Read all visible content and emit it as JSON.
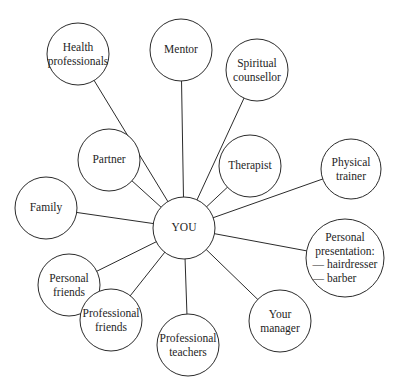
{
  "diagram": {
    "title": "",
    "center": {
      "id": "you",
      "label": [
        "YOU"
      ],
      "cx": 184,
      "cy": 228,
      "r": 31
    },
    "nodes": [
      {
        "id": "health-professionals",
        "label": [
          "Health",
          "professionals"
        ],
        "cx": 78,
        "cy": 54,
        "r": 31
      },
      {
        "id": "mentor",
        "label": [
          "Mentor"
        ],
        "cx": 181,
        "cy": 50,
        "r": 31
      },
      {
        "id": "spiritual-counsellor",
        "label": [
          "Spiritual",
          "counsellor"
        ],
        "cx": 257,
        "cy": 70,
        "r": 31
      },
      {
        "id": "partner",
        "label": [
          "Partner"
        ],
        "cx": 109,
        "cy": 160,
        "r": 31
      },
      {
        "id": "therapist",
        "label": [
          "Therapist"
        ],
        "cx": 250,
        "cy": 166,
        "r": 31
      },
      {
        "id": "physical-trainer",
        "label": [
          "Physical",
          "trainer"
        ],
        "cx": 351,
        "cy": 169,
        "r": 30
      },
      {
        "id": "family",
        "label": [
          "Family"
        ],
        "cx": 46,
        "cy": 208,
        "r": 31
      },
      {
        "id": "personal-presentation",
        "label": [
          "Personal",
          "presentation:",
          "— hairdresser",
          "— barber"
        ],
        "cx": 345,
        "cy": 258,
        "r": 39
      },
      {
        "id": "personal-friends",
        "label": [
          "Personal",
          "friends"
        ],
        "cx": 69,
        "cy": 285,
        "r": 31
      },
      {
        "id": "professional-friends",
        "label": [
          "Professional",
          "friends"
        ],
        "cx": 111,
        "cy": 320,
        "r": 31
      },
      {
        "id": "professional-teachers",
        "label": [
          "Professional",
          "teachers"
        ],
        "cx": 188,
        "cy": 345,
        "r": 31
      },
      {
        "id": "your-manager",
        "label": [
          "Your",
          "manager"
        ],
        "cx": 280,
        "cy": 321,
        "r": 31
      }
    ],
    "edges": [
      {
        "from": "you",
        "to": "health-professionals"
      },
      {
        "from": "you",
        "to": "mentor"
      },
      {
        "from": "you",
        "to": "spiritual-counsellor"
      },
      {
        "from": "you",
        "to": "partner"
      },
      {
        "from": "you",
        "to": "therapist"
      },
      {
        "from": "you",
        "to": "physical-trainer"
      },
      {
        "from": "you",
        "to": "family"
      },
      {
        "from": "you",
        "to": "personal-presentation"
      },
      {
        "from": "you",
        "to": "personal-friends"
      },
      {
        "from": "you",
        "to": "professional-friends"
      },
      {
        "from": "you",
        "to": "professional-teachers"
      },
      {
        "from": "you",
        "to": "your-manager"
      }
    ],
    "colors": {
      "stroke": "#2b2b2b",
      "fill": "#ffffff",
      "text": "#1e1e1e"
    }
  }
}
